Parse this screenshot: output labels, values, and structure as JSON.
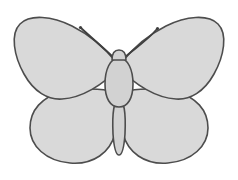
{
  "image": {
    "title": "Butterfly",
    "subject": "butterfly",
    "style": "flat line drawing, bilaterally symmetric, no text labels",
    "width": 238,
    "height": 180
  },
  "palette": {
    "background": "#ffffff",
    "wing_fill": "#d9d9d9",
    "body_fill": "#d2d2d2",
    "outline": "#4d4d4d",
    "antenna": "#3f3f3f"
  },
  "geometry": {
    "stroke_width": 1.6,
    "antenna_stroke_width": 1.9,
    "axis_of_symmetry_x": 119
  },
  "parts": {
    "forewing_left": {
      "label": "Left forewing",
      "path": "M 116 62 C 108 52, 92 36, 72 26 C 52 16, 30 14, 20 24 C 10 34, 14 56, 24 74 C 34 92, 48 100, 62 99 C 82 98, 104 84, 116 70 Z"
    },
    "forewing_right": {
      "label": "Right forewing",
      "path": "M 122 62 C 130 52, 146 36, 166 26 C 186 16, 208 14, 218 24 C 228 34, 224 56, 214 74 C 204 92, 190 100, 176 99 C 156 98, 134 84, 122 70 Z"
    },
    "hindwing_left": {
      "label": "Left hindwing",
      "path": "M 114 92 C 102 88, 80 88, 62 92 C 42 97, 30 110, 30 128 C 30 146, 46 161, 70 163 C 94 165, 110 152, 115 134 C 118 120, 118 102, 114 92 Z"
    },
    "hindwing_right": {
      "label": "Right hindwing",
      "path": "M 124 92 C 136 88, 158 88, 176 92 C 196 97, 208 110, 208 128 C 208 146, 192 161, 168 163 C 144 165, 128 152, 123 134 C 120 120, 120 102, 124 92 Z"
    },
    "thorax": {
      "label": "Thorax",
      "path": "M 119 58 C 128 58, 133 70, 133 84 C 133 98, 128 107, 119 107 C 110 107, 105 98, 105 84 C 105 70, 110 58, 119 58 Z"
    },
    "head": {
      "label": "Head",
      "path": "M 112 60 C 112 53, 115 50, 119 50 C 123 50, 126 53, 126 60 Z"
    },
    "abdomen": {
      "label": "Abdomen",
      "path": "M 119 100 C 124 100, 126 112, 125 134 C 124 148, 122 155, 119 155 C 116 155, 114 148, 113 134 C 112 112, 114 100, 119 100 Z"
    },
    "antenna_left": {
      "label": "Left antenna",
      "path": "M 114 58 C 106 50, 94 40, 81 28"
    },
    "antenna_right": {
      "label": "Right antenna",
      "path": "M 124 58 C 132 50, 146 42, 157 29"
    },
    "antenna_club_left": {
      "label": "Left antenna club",
      "cx": 80.5,
      "cy": 27.5,
      "r": 1.6
    },
    "antenna_club_right": {
      "label": "Right antenna club",
      "cx": 157.5,
      "cy": 28.5,
      "r": 1.6
    }
  }
}
